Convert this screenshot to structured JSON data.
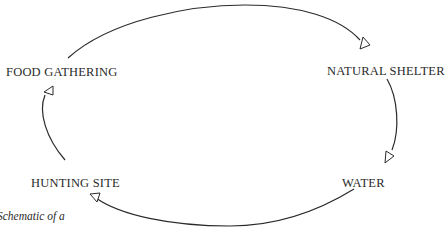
{
  "diagram": {
    "type": "cycle",
    "nodes": [
      {
        "id": "food_gathering",
        "label": "FOOD GATHERING"
      },
      {
        "id": "natural_shelter",
        "label": "NATURAL SHELTER"
      },
      {
        "id": "water",
        "label": "WATER"
      },
      {
        "id": "hunting_site",
        "label": "HUNTING SITE"
      }
    ],
    "edges": [
      {
        "from": "food_gathering",
        "to": "natural_shelter",
        "arrow": "open-triangle"
      },
      {
        "from": "natural_shelter",
        "to": "water",
        "arrow": "open-triangle"
      },
      {
        "from": "water",
        "to": "hunting_site",
        "arrow": "open-triangle"
      },
      {
        "from": "hunting_site",
        "to": "food_gathering",
        "arrow": "open-triangle"
      }
    ],
    "caption": "Schematic of a",
    "colors": {
      "stroke": "#2a2a2a",
      "text": "#2a2a2a",
      "background": "#ffffff"
    }
  }
}
